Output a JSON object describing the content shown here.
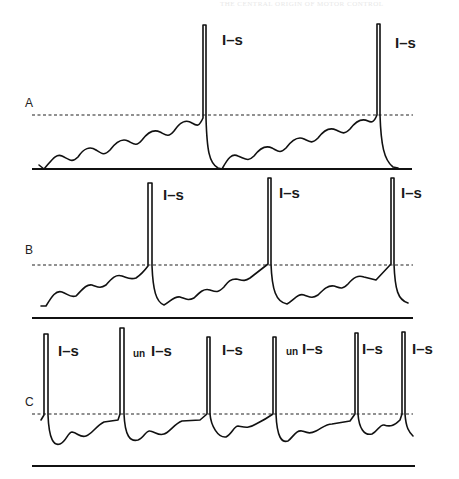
{
  "page": {
    "running_head": "THE CENTRAL ORIGIN OF MOTOR CONTROL"
  },
  "figure": {
    "panels": [
      {
        "id": "A",
        "letter": "A",
        "labels": [
          "I–s",
          "I–s"
        ],
        "spike_count": 2,
        "description": "slow depolarizing oscillations ramp to threshold; 2 spikes"
      },
      {
        "id": "B",
        "letter": "B",
        "labels": [
          "I–s",
          "I–s",
          "I–s"
        ],
        "spike_count": 3,
        "description": "faster ramp; 3 spikes"
      },
      {
        "id": "C",
        "letter": "C",
        "labels": [
          {
            "prefix": "",
            "text": "I–s"
          },
          {
            "prefix": "un",
            "text": "I–s"
          },
          {
            "prefix": "",
            "text": "I–s"
          },
          {
            "prefix": "un",
            "text": "I–s"
          },
          {
            "prefix": "",
            "text": "I–s"
          },
          {
            "prefix": "",
            "text": "I–s"
          }
        ],
        "spike_count": 6,
        "description": "rapid firing with short interspike intervals; 6 spikes"
      }
    ],
    "colors": {
      "ink": "#111111",
      "background": "#ffffff"
    }
  }
}
